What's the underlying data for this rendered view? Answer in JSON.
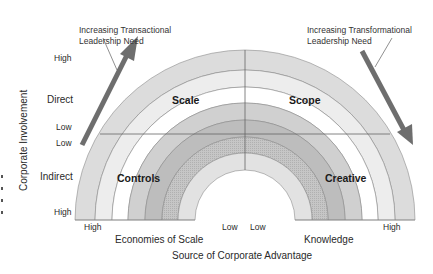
{
  "figure": {
    "quadrants": {
      "top_left": "Scale",
      "top_right": "Scope",
      "bottom_left": "Controls",
      "bottom_right": "Creative"
    },
    "annotations": {
      "left": {
        "line1": "Increasing Transactional",
        "line2": "Leadership Need"
      },
      "right": {
        "line1": "Increasing Transformational",
        "line2": "Leadership Need"
      }
    },
    "y_axis": {
      "title": "Corporate Involvement",
      "direct_label": "Direct",
      "indirect_label": "Indirect",
      "ticks": {
        "top_high": "High",
        "upper_low": "Low",
        "lower_low": "Low",
        "bottom_high": "High"
      }
    },
    "x_axis": {
      "title": "Source of Corporate Advantage",
      "left_label": "Economies of Scale",
      "right_label": "Knowledge",
      "ticks": {
        "left_high": "High",
        "left_low": "Low",
        "right_low": "Low",
        "right_high": "High"
      }
    },
    "rings": [
      {
        "outer_r": 170,
        "inner_r": 150,
        "color": "#dcdcdc"
      },
      {
        "outer_r": 150,
        "inner_r": 133,
        "color": "#ededed"
      },
      {
        "outer_r": 133,
        "inner_r": 117,
        "color": "#ffffff"
      },
      {
        "outer_r": 117,
        "inner_r": 100,
        "color": "#d0d0d0"
      },
      {
        "outer_r": 100,
        "inner_r": 83,
        "color": "#bdbdbd"
      },
      {
        "outer_r": 83,
        "inner_r": 67,
        "color": "#c6c6c6"
      },
      {
        "outer_r": 67,
        "inner_r": 50,
        "color": "#e2e2e2"
      }
    ],
    "colors": {
      "arrow": "#6e6e6e",
      "lines": "#777777"
    }
  }
}
